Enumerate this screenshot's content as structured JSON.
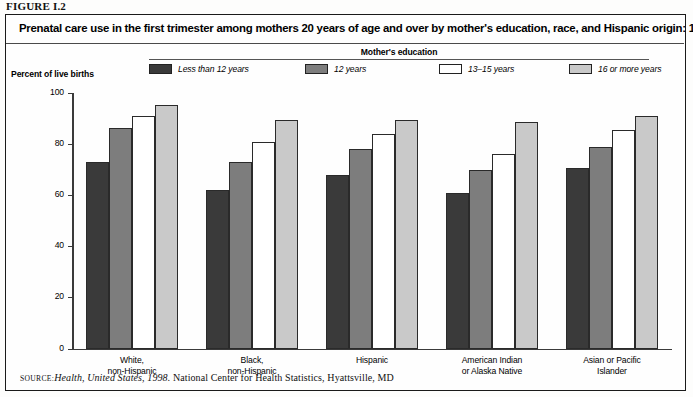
{
  "figure": {
    "label": "FIGURE I.2",
    "title": "Prenatal care use in the first trimester among mothers 20 years of age and over by mother's education, race, and Hispanic origin: 1996"
  },
  "legend": {
    "heading": "Mother's education",
    "items": [
      {
        "label": "Less than 12 years",
        "color": "#3a3a3a"
      },
      {
        "label": "12 years",
        "color": "#7d7d7d"
      },
      {
        "label": "13–15 years",
        "color": "#ffffff"
      },
      {
        "label": "16 or more years",
        "color": "#c9c9c9"
      }
    ]
  },
  "axes": {
    "y_title": "Percent of live births",
    "y_ticks": [
      "0",
      "20",
      "40",
      "60",
      "80",
      "100"
    ]
  },
  "source": {
    "kicker": "Source:",
    "italic_part": "Health, United States, 1998.",
    "rest": " National Center for Health Statistics, Hyattsville, MD"
  },
  "chart_data": {
    "type": "bar",
    "title": "Prenatal care use in the first trimester among mothers 20 years of age and over by mother's education, race, and Hispanic origin: 1996",
    "xlabel": "",
    "ylabel": "Percent of live births",
    "ylim": [
      0,
      100
    ],
    "yticks": [
      0,
      20,
      40,
      60,
      80,
      100
    ],
    "grid": false,
    "legend_position": "top",
    "legend_title": "Mother's education",
    "categories": [
      "White, non-Hispanic",
      "Black, non-Hispanic",
      "Hispanic",
      "American Indian or Alaska Native",
      "Asian or Pacific Islander"
    ],
    "series": [
      {
        "name": "Less than 12 years",
        "color": "#3a3a3a",
        "values": [
          73,
          62,
          68,
          61,
          70.5
        ]
      },
      {
        "name": "12 years",
        "color": "#7d7d7d",
        "values": [
          86.5,
          73,
          78,
          70,
          79
        ]
      },
      {
        "name": "13–15 years",
        "color": "#ffffff",
        "values": [
          91,
          81,
          84,
          76,
          85.5
        ]
      },
      {
        "name": "16 or more years",
        "color": "#c9c9c9",
        "values": [
          95.5,
          89.5,
          89.5,
          88.5,
          91
        ]
      }
    ]
  },
  "group_labels": [
    [
      "White,",
      "non-Hispanic"
    ],
    [
      "Black,",
      "non-Hispanic"
    ],
    [
      "Hispanic",
      ""
    ],
    [
      "American Indian",
      "or Alaska Native"
    ],
    [
      "Asian or Pacific",
      "Islander"
    ]
  ]
}
